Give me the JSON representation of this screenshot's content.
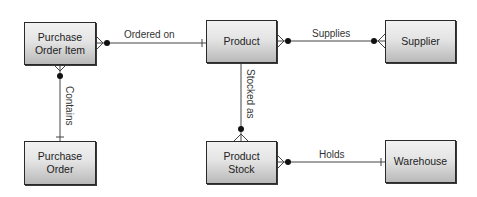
{
  "diagram": {
    "type": "entity-relationship",
    "entities": [
      {
        "id": "purchase_order_item",
        "label": "Purchase Order Item",
        "line1": "Purchase",
        "line2": "Order Item"
      },
      {
        "id": "product",
        "label": "Product"
      },
      {
        "id": "supplier",
        "label": "Supplier"
      },
      {
        "id": "purchase_order",
        "label": "Purchase Order",
        "line1": "Purchase",
        "line2": "Order"
      },
      {
        "id": "product_stock",
        "label": "Product Stock",
        "line1": "Product",
        "line2": "Stock"
      },
      {
        "id": "warehouse",
        "label": "Warehouse"
      }
    ],
    "relationships": [
      {
        "label": "Ordered on",
        "from": "Purchase Order Item",
        "to": "Product",
        "from_cardinality": "zero-or-many",
        "to_cardinality": "one"
      },
      {
        "label": "Supplies",
        "from": "Product",
        "to": "Supplier",
        "from_cardinality": "zero-or-many",
        "to_cardinality": "zero-or-many"
      },
      {
        "label": "Contains",
        "from": "Purchase Order Item",
        "to": "Purchase Order",
        "from_cardinality": "zero-or-many",
        "to_cardinality": "one"
      },
      {
        "label": "Stocked as",
        "from": "Product",
        "to": "Product Stock",
        "from_cardinality": "one",
        "to_cardinality": "zero-or-many"
      },
      {
        "label": "Holds",
        "from": "Product Stock",
        "to": "Warehouse",
        "from_cardinality": "zero-or-many",
        "to_cardinality": "one"
      }
    ],
    "colors": {
      "line": "#444444",
      "box_border": "#2a2a2a",
      "box_gradient_top": "#f2f2f2",
      "box_gradient_bottom": "#b9b9b9",
      "text": "#222222"
    }
  }
}
